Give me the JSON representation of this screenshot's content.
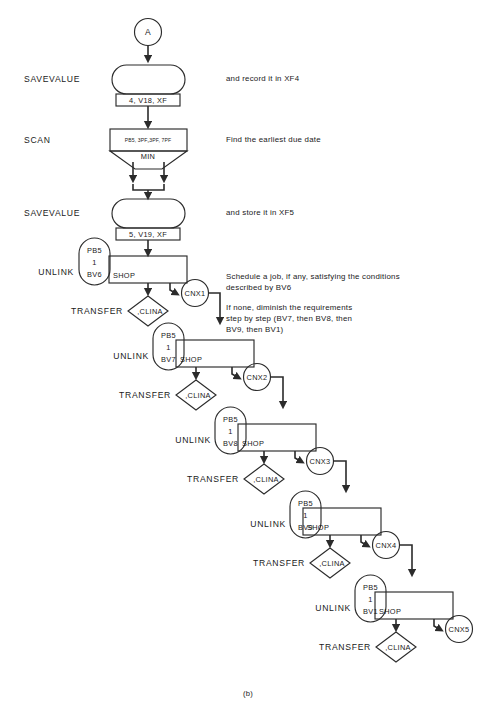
{
  "figure": {
    "caption": "(b)",
    "start_connector": "A"
  },
  "stage_labels": {
    "savevalue": "SAVEVALUE",
    "scan": "SCAN",
    "unlink": "UNLINK",
    "transfer": "TRANSFER"
  },
  "blocks": [
    {
      "id": "savevalue-1",
      "type": "savevalue",
      "stage_label": "SAVEVALUE",
      "operands": "4, V18, XF",
      "note": "and record it in XF4"
    },
    {
      "id": "scan-1",
      "type": "scan",
      "stage_label": "SCAN",
      "operands": "PB5, 3PF„3PF, 7PF",
      "mode": "MIN",
      "note": "Find the earliest due date"
    },
    {
      "id": "savevalue-2",
      "type": "savevalue",
      "stage_label": "SAVEVALUE",
      "operands": "5, V19, XF",
      "note": "and store it in XF5"
    }
  ],
  "notes": [
    "Schedule a job, if any, satisfying the conditions",
    "described by BV6",
    "If none, diminish the requirements",
    "step by step (BV7, then BV8, then",
    "BV9, then BV1)"
  ],
  "unlink_stages": [
    {
      "id": "unlink-bv6",
      "stage_label": "UNLINK",
      "condition": [
        "PB5",
        "1",
        "BV6"
      ],
      "block_label": "SHOP",
      "transfer_label": "TRANSFER",
      "transfer_target": ",CLINA",
      "connector": "CNX1"
    },
    {
      "id": "unlink-bv7",
      "stage_label": "UNLINK",
      "condition": [
        "PB5",
        "1",
        "BV7"
      ],
      "block_label": "SHOP",
      "transfer_label": "TRANSFER",
      "transfer_target": ",CLINA",
      "connector": "CNX2"
    },
    {
      "id": "unlink-bv8",
      "stage_label": "UNLINK",
      "condition": [
        "PB5",
        "1",
        "BV8"
      ],
      "block_label": "SHOP",
      "transfer_label": "TRANSFER",
      "transfer_target": ",CLINA",
      "connector": "CNX3"
    },
    {
      "id": "unlink-bv9",
      "stage_label": "UNLINK",
      "condition": [
        "PB5",
        "1",
        "BV9"
      ],
      "block_label": "SHOP",
      "transfer_label": "TRANSFER",
      "transfer_target": ",CLINA",
      "connector": "CNX4"
    },
    {
      "id": "unlink-bv1",
      "stage_label": "UNLINK",
      "condition": [
        "PB5",
        "1",
        "BV1"
      ],
      "block_label": "SHOP",
      "transfer_label": "TRANSFER",
      "transfer_target": ",CLINA",
      "connector": "CNX5"
    }
  ],
  "colors": {
    "ink": "#1a1a1a",
    "stroke": "#2b2b2b",
    "paper": "#ffffff"
  }
}
